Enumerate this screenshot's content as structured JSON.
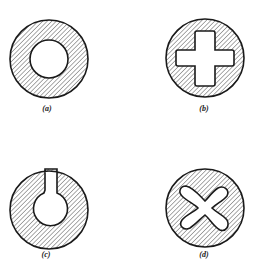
{
  "figures": [
    {
      "id": "a",
      "label": "(a)",
      "shape": "hollow circular section",
      "cx": 49,
      "cy": 59,
      "label_x": 47,
      "label_y": 104
    },
    {
      "id": "b",
      "label": "(b)",
      "shape": "circular section with cross-shaped hole",
      "cx": 205,
      "cy": 58,
      "label_x": 204,
      "label_y": 104
    },
    {
      "id": "c",
      "label": "(c)",
      "shape": "circular section with keyhole-shaped hole",
      "cx": 49,
      "cy": 210,
      "label_x": 46,
      "label_y": 250
    },
    {
      "id": "d",
      "label": "(d)",
      "shape": "circular section with four-lobed hole",
      "cx": 205,
      "cy": 208,
      "label_x": 204,
      "label_y": 250
    }
  ],
  "style": {
    "stroke": "#1a1a1a",
    "hatch": "#444444",
    "background": "#ffffff"
  }
}
